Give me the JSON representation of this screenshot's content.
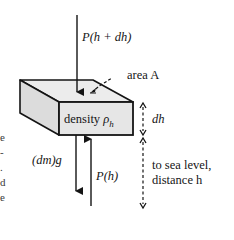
{
  "diagram": {
    "type": "free-body diagram of an air slab",
    "labels": {
      "top_force": "P(h + dh)",
      "area": "area A",
      "density_word": "density",
      "density_symbol": "ρ",
      "density_sub": "h",
      "thickness": "dh",
      "weight": "(dm)g",
      "bottom_force": "P(h)",
      "sea_level_line1": "to sea level,",
      "sea_level_line2": "distance h"
    },
    "margin_fragments": [
      "e",
      "-",
      ".",
      "d",
      "e"
    ],
    "colors": {
      "ink": "#141414",
      "box_front": "#e6e6e6",
      "box_top": "#ececec",
      "box_side": "#dcdcdc",
      "background": "#ffffff"
    }
  }
}
